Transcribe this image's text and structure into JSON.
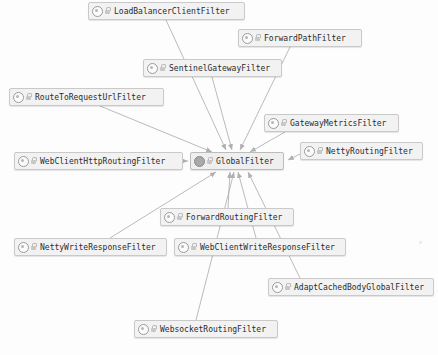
{
  "diagram": {
    "type": "uml-class-diagram",
    "background_color": "#fdfdfd",
    "node_fill": "#f2f2f2",
    "node_border": "#c9c9c9",
    "edge_color": "#a9a9a9",
    "text_color": "#2b2b2b",
    "nodes": [
      {
        "id": "loadBalancerClientFilter",
        "label": "LoadBalancerClientFilter",
        "icon": "class-icon",
        "badge": "lock-icon",
        "x": 88,
        "y": 2,
        "w": 157,
        "kind": "class"
      },
      {
        "id": "forwardPathFilter",
        "label": "ForwardPathFilter",
        "icon": "class-icon",
        "badge": "lock-icon",
        "x": 238,
        "y": 29,
        "w": 124,
        "kind": "class"
      },
      {
        "id": "sentinelGatewayFilter",
        "label": "SentinelGatewayFilter",
        "icon": "class-icon",
        "badge": "lock-icon",
        "x": 143,
        "y": 59,
        "w": 139,
        "kind": "class"
      },
      {
        "id": "routeToRequestUrlFilter",
        "label": "RouteToRequestUrlFilter",
        "icon": "class-icon",
        "badge": "lock-icon",
        "x": 9,
        "y": 88,
        "w": 155,
        "kind": "class"
      },
      {
        "id": "gatewayMetricsFilter",
        "label": "GatewayMetricsFilter",
        "icon": "class-icon",
        "badge": "lock-icon",
        "x": 264,
        "y": 114,
        "w": 135,
        "kind": "class"
      },
      {
        "id": "nettyRoutingFilter",
        "label": "NettyRoutingFilter",
        "icon": "class-icon",
        "badge": "lock-icon",
        "x": 300,
        "y": 142,
        "w": 123,
        "kind": "class"
      },
      {
        "id": "webClientHttpRoutingFilter",
        "label": "WebClientHttpRoutingFilter",
        "icon": "class-icon",
        "badge": "lock-icon",
        "x": 14,
        "y": 152,
        "w": 169,
        "kind": "class"
      },
      {
        "id": "globalFilter",
        "label": "GlobalFilter",
        "icon": "interface-icon",
        "badge": "lock-icon",
        "x": 190,
        "y": 152,
        "w": 94,
        "kind": "interface"
      },
      {
        "id": "forwardRoutingFilter",
        "label": "ForwardRoutingFilter",
        "icon": "class-icon",
        "badge": "lock-icon",
        "x": 160,
        "y": 208,
        "w": 134,
        "kind": "class"
      },
      {
        "id": "nettyWriteResponseFilter",
        "label": "NettyWriteResponseFilter",
        "icon": "class-icon",
        "badge": "lock-icon",
        "x": 14,
        "y": 238,
        "w": 153,
        "kind": "class"
      },
      {
        "id": "webClientWriteResponseFilter",
        "label": "WebClientWriteResponseFilter",
        "icon": "class-icon",
        "badge": "lock-icon",
        "x": 174,
        "y": 238,
        "w": 172,
        "kind": "class"
      },
      {
        "id": "adaptCachedBodyGlobalFilter",
        "label": "AdaptCachedBodyGlobalFilter",
        "icon": "class-icon",
        "badge": "lock-icon",
        "x": 268,
        "y": 278,
        "w": 166,
        "kind": "class"
      },
      {
        "id": "websocketRoutingFilter",
        "label": "WebsocketRoutingFilter",
        "icon": "class-icon",
        "badge": "lock-icon",
        "x": 134,
        "y": 320,
        "w": 144,
        "kind": "class"
      }
    ],
    "edges": [
      {
        "from": "loadBalancerClientFilter",
        "to": "globalFilter",
        "x1": 166,
        "y1": 20,
        "x2": 226,
        "y2": 150
      },
      {
        "from": "forwardPathFilter",
        "to": "globalFilter",
        "x1": 290,
        "y1": 47,
        "x2": 240,
        "y2": 150
      },
      {
        "from": "sentinelGatewayFilter",
        "to": "globalFilter",
        "x1": 212,
        "y1": 77,
        "x2": 232,
        "y2": 150
      },
      {
        "from": "routeToRequestUrlFilter",
        "to": "globalFilter",
        "x1": 100,
        "y1": 106,
        "x2": 212,
        "y2": 152
      },
      {
        "from": "gatewayMetricsFilter",
        "to": "globalFilter",
        "x1": 285,
        "y1": 132,
        "x2": 250,
        "y2": 152
      },
      {
        "from": "nettyRoutingFilter",
        "to": "globalFilter",
        "x1": 300,
        "y1": 154,
        "x2": 288,
        "y2": 160
      },
      {
        "from": "webClientHttpRoutingFilter",
        "to": "globalFilter",
        "x1": 183,
        "y1": 161,
        "x2": 188,
        "y2": 161
      },
      {
        "from": "forwardRoutingFilter",
        "to": "globalFilter",
        "x1": 228,
        "y1": 208,
        "x2": 230,
        "y2": 172
      },
      {
        "from": "nettyWriteResponseFilter",
        "to": "globalFilter",
        "x1": 110,
        "y1": 238,
        "x2": 216,
        "y2": 172
      },
      {
        "from": "webClientWriteResponseFilter",
        "to": "globalFilter",
        "x1": 256,
        "y1": 238,
        "x2": 238,
        "y2": 172
      },
      {
        "from": "adaptCachedBodyGlobalFilter",
        "to": "globalFilter",
        "x1": 300,
        "y1": 278,
        "x2": 248,
        "y2": 172
      },
      {
        "from": "websocketRoutingFilter",
        "to": "globalFilter",
        "x1": 196,
        "y1": 320,
        "x2": 234,
        "y2": 172
      }
    ]
  }
}
